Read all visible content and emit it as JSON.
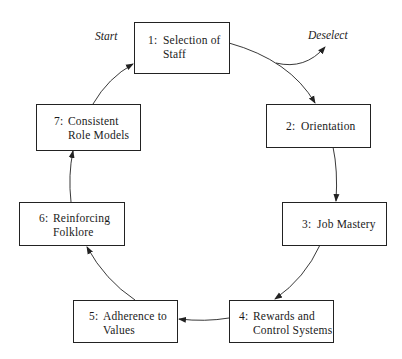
{
  "diagram": {
    "type": "cycle",
    "nodes": [
      {
        "id": 1,
        "num": "1:",
        "line1": "Selection of",
        "line2": "Staff"
      },
      {
        "id": 2,
        "num": "2:",
        "line1": "Orientation",
        "line2": ""
      },
      {
        "id": 3,
        "num": "3:",
        "line1": "Job Mastery",
        "line2": ""
      },
      {
        "id": 4,
        "num": "4:",
        "line1": "Rewards and",
        "line2": "Control Systems"
      },
      {
        "id": 5,
        "num": "5:",
        "line1": "Adherence to",
        "line2": "Values"
      },
      {
        "id": 6,
        "num": "6:",
        "line1": "Reinforcing",
        "line2": "Folklore"
      },
      {
        "id": 7,
        "num": "7:",
        "line1": "Consistent",
        "line2": "Role Models"
      }
    ],
    "edges": [
      {
        "from": 1,
        "to": 2
      },
      {
        "from": 2,
        "to": 3
      },
      {
        "from": 3,
        "to": 4
      },
      {
        "from": 4,
        "to": 5
      },
      {
        "from": 5,
        "to": 6
      },
      {
        "from": 6,
        "to": 7
      },
      {
        "from": 7,
        "to": 1
      },
      {
        "from": 1,
        "to": "Deselect",
        "branch": true
      }
    ],
    "labels": {
      "start": "Start",
      "deselect": "Deselect"
    },
    "colors": {
      "line": "#222222",
      "background": "#ffffff"
    }
  }
}
